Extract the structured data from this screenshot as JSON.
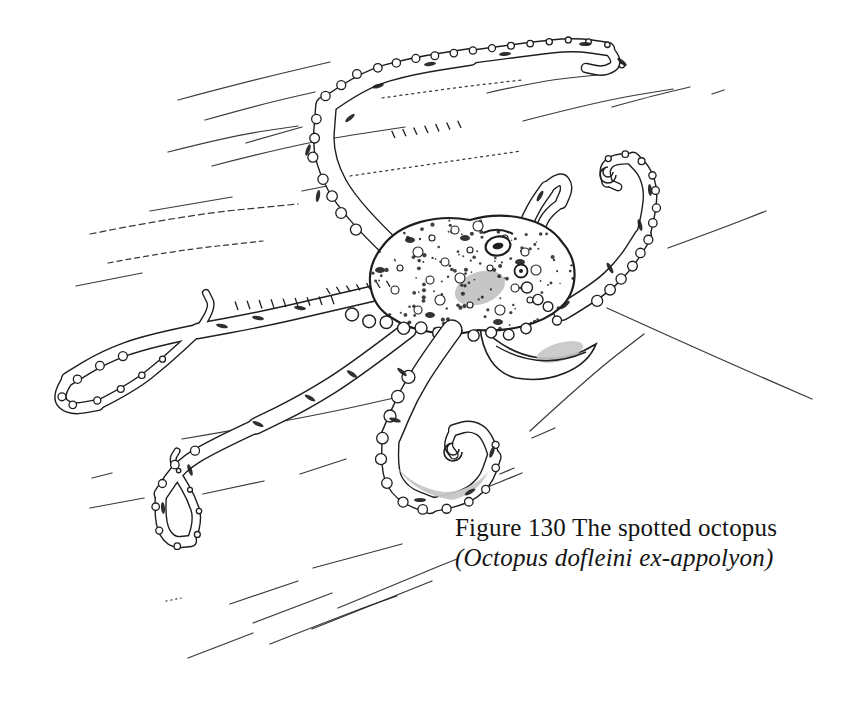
{
  "figure": {
    "number": "130",
    "subject": "The spotted octopus",
    "species_binomial": "Octopus dofleini ex-appolyon",
    "caption": {
      "line1": "Figure 130 The spotted octopus",
      "line2": "(Octopus dofleini ex-appolyon)"
    }
  },
  "illustration": {
    "description": "pen-and-ink drawing of a spotted octopus with trailing water-current lines",
    "ink_color": "#1e1e1e",
    "paper_color": "#ffffff",
    "shade_color": "#c6c6c6"
  }
}
